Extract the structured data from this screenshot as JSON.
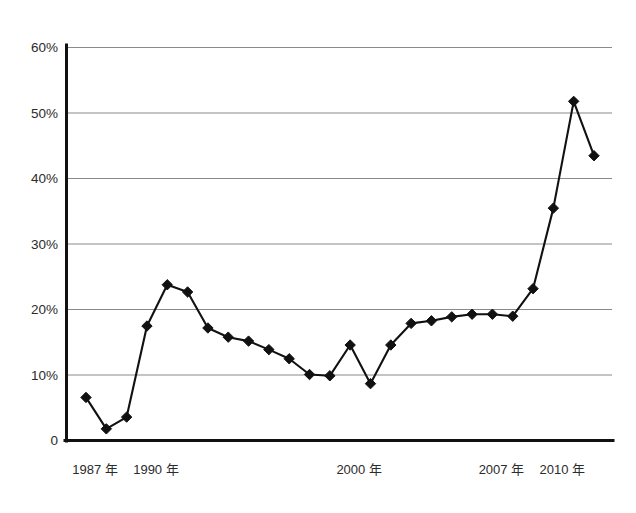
{
  "chart_data": {
    "type": "line",
    "title": "",
    "subtitle": "",
    "xlabel": "",
    "ylabel": "",
    "grid": true,
    "legend": "none",
    "xlim": [
      1987,
      2010
    ],
    "ylim": [
      0,
      60
    ],
    "y_tick_labels": [
      "60%",
      "50%",
      "40%",
      "30%",
      "20%",
      "10%",
      "0"
    ],
    "y_tick_values": [
      60,
      50,
      40,
      30,
      20,
      10,
      0
    ],
    "x_tick_labels": [
      "1987 年",
      "1990 年",
      "2000 年",
      "2007 年",
      "2010 年"
    ],
    "x_tick_values": [
      1987,
      1990,
      2000,
      2007,
      2010
    ],
    "x": [
      1987,
      1988,
      1989,
      1990,
      1991,
      1992,
      1993,
      1994,
      1995,
      1996,
      1997,
      1998,
      1999,
      2000,
      2001,
      2002,
      2003,
      2004,
      2005,
      2006,
      2007,
      2008,
      2009,
      2010
    ],
    "series": [
      {
        "name": "series-1",
        "marker": "diamond",
        "color": "#111111",
        "values": [
          6.5,
          1.7,
          3.5,
          17.4,
          23.7,
          22.6,
          17.1,
          15.7,
          15.1,
          13.8,
          12.4,
          10.0,
          9.8,
          14.5,
          8.6,
          14.5,
          17.8,
          18.2,
          18.8,
          19.2,
          19.2,
          18.9,
          23.1,
          35.4
        ]
      }
    ],
    "values_full": [
      6.5,
      1.7,
      3.5,
      17.4,
      23.7,
      22.6,
      17.1,
      15.7,
      15.1,
      13.8,
      12.4,
      10.0,
      9.8,
      14.5,
      8.6,
      14.5,
      17.8,
      18.2,
      18.8,
      19.2,
      19.2,
      18.9,
      23.1,
      35.4,
      51.7,
      43.4
    ],
    "points": [
      {
        "x": 1987,
        "y": 6.5
      },
      {
        "x": 1988,
        "y": 1.7
      },
      {
        "x": 1989,
        "y": 3.5
      },
      {
        "x": 1990,
        "y": 17.4
      },
      {
        "x": 1991,
        "y": 23.7
      },
      {
        "x": 1992,
        "y": 22.6
      },
      {
        "x": 1993,
        "y": 17.1
      },
      {
        "x": 1994,
        "y": 15.7
      },
      {
        "x": 1995,
        "y": 15.1
      },
      {
        "x": 1996,
        "y": 13.8
      },
      {
        "x": 1997,
        "y": 12.4
      },
      {
        "x": 1998,
        "y": 10.0
      },
      {
        "x": 1999,
        "y": 9.8
      },
      {
        "x": 2000,
        "y": 14.5
      },
      {
        "x": 2001,
        "y": 8.6
      },
      {
        "x": 2002,
        "y": 14.5
      },
      {
        "x": 2003,
        "y": 17.8
      },
      {
        "x": 2004,
        "y": 18.2
      },
      {
        "x": 2005,
        "y": 18.8
      },
      {
        "x": 2006,
        "y": 19.2
      },
      {
        "x": 2007,
        "y": 19.2
      },
      {
        "x": 2008,
        "y": 18.9
      },
      {
        "x": 2009,
        "y": 23.1
      },
      {
        "x": 2010,
        "y": 35.4
      },
      {
        "x": 2011,
        "y": 51.7
      },
      {
        "x": 2012,
        "y": 43.4
      }
    ],
    "colors": {
      "line": "#111111",
      "marker": "#111111",
      "grid": "#8a8a8a",
      "axis": "#111111",
      "background": "#ffffff",
      "text": "#2b2b2b"
    }
  }
}
